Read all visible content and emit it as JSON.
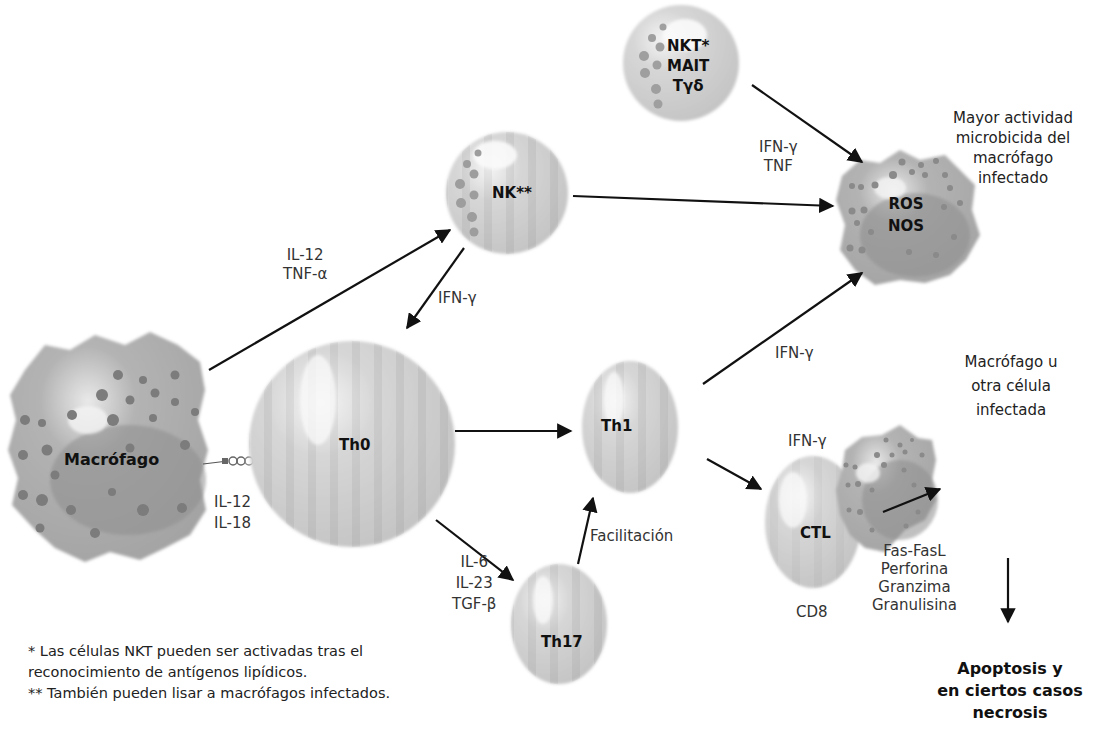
{
  "cells": {
    "macrofago": {
      "label": "Macrófago"
    },
    "th0": {
      "label": "Th0"
    },
    "nk": {
      "label": "NK**"
    },
    "nkt_group": {
      "lines": [
        "NKT*",
        "MAIT",
        "Tγδ"
      ]
    },
    "th1": {
      "label": "Th1"
    },
    "th17": {
      "label": "Th17"
    },
    "ctl": {
      "label": "CTL"
    },
    "activated_macrophage": {
      "lines": [
        "ROS",
        "NOS"
      ]
    },
    "infected_cell": {
      "label": ""
    }
  },
  "labels": {
    "mac_to_nk": [
      "IL-12",
      "TNF-α"
    ],
    "nk_to_th0": [
      "IFN-γ"
    ],
    "mac_to_th0": [
      "IL-12",
      "IL-18"
    ],
    "nkt_to_mac": [
      "IFN-γ",
      "TNF"
    ],
    "th1_to_mac": [
      "IFN-γ"
    ],
    "th0_to_th17": [
      "IL-6",
      "IL-23",
      "TGF-β"
    ],
    "th17_to_th1": [
      "Facilitación"
    ],
    "ctl_top": [
      "IFN-γ"
    ],
    "ctl_bottom": [
      "CD8"
    ],
    "ctl_to_infected": [
      "Fas-FasL",
      "Perforina",
      "Granzima",
      "Granulisina"
    ]
  },
  "outcomes": {
    "microbicidal": [
      "Mayor actividad",
      "microbicida del",
      "macrófago",
      "infectado"
    ],
    "infected_target": [
      "Macrófago u",
      "otra célula",
      "infectada"
    ],
    "death": [
      "Apoptosis y",
      "en ciertos casos",
      "necrosis"
    ]
  },
  "footnotes": [
    "* Las células NKT pueden ser activadas tras el",
    "reconocimiento de antígenos lipídicos.",
    "** También pueden lisar a macrófagos infectados."
  ],
  "colors": {
    "cell_fill": "#cfcfcf",
    "cell_stripe": "#bdbdbd",
    "macrophage_fill": "#a9a9a9",
    "nucleus_fill": "#8e8e8e",
    "granule": "#7a7a7a",
    "arrow": "#111111"
  }
}
